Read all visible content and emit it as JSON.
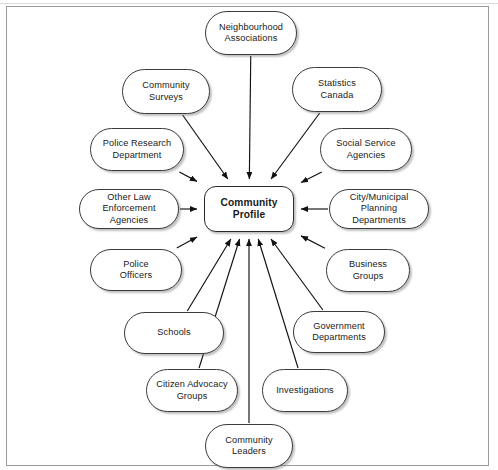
{
  "diagram": {
    "type": "radial-concept-map",
    "frame": {
      "border_color": "#9a9a9a"
    },
    "center": {
      "id": "community-profile",
      "label": "Community\nProfile",
      "x": 204,
      "y": 186,
      "w": 90,
      "h": 46
    },
    "nodes": [
      {
        "id": "neighbourhood-associations",
        "label": "Neighbourhood\nAssociations",
        "x": 205,
        "y": 11,
        "w": 92,
        "h": 44
      },
      {
        "id": "community-surveys",
        "label": "Community\nSurveys",
        "x": 122,
        "y": 69,
        "w": 88,
        "h": 45
      },
      {
        "id": "statistics-canada",
        "label": "Statistics\nCanada",
        "x": 292,
        "y": 67,
        "w": 90,
        "h": 45
      },
      {
        "id": "police-research-department",
        "label": "Police Research\nDepartment",
        "x": 90,
        "y": 128,
        "w": 94,
        "h": 43
      },
      {
        "id": "social-service-agencies",
        "label": "Social Service\nAgencies",
        "x": 320,
        "y": 128,
        "w": 92,
        "h": 43
      },
      {
        "id": "other-law-enforcement",
        "label": "Other Law Enforcement\nAgencies",
        "x": 79,
        "y": 189,
        "w": 100,
        "h": 40
      },
      {
        "id": "city-municipal-planning",
        "label": "City/Municipal\nPlanning Departments",
        "x": 329,
        "y": 189,
        "w": 100,
        "h": 40
      },
      {
        "id": "police-officers",
        "label": "Police\nOfficers",
        "x": 90,
        "y": 249,
        "w": 92,
        "h": 42
      },
      {
        "id": "business-groups",
        "label": "Business\nGroups",
        "x": 326,
        "y": 249,
        "w": 84,
        "h": 43
      },
      {
        "id": "schools",
        "label": "Schools",
        "x": 124,
        "y": 312,
        "w": 100,
        "h": 42
      },
      {
        "id": "government-departments",
        "label": "Government\nDepartments",
        "x": 293,
        "y": 311,
        "w": 92,
        "h": 42
      },
      {
        "id": "citizen-advocacy-groups",
        "label": "Citizen Advocacy\nGroups",
        "x": 146,
        "y": 369,
        "w": 92,
        "h": 43
      },
      {
        "id": "investigations",
        "label": "Investigations",
        "x": 262,
        "y": 369,
        "w": 86,
        "h": 43
      },
      {
        "id": "community-leaders",
        "label": "Community\nLeaders",
        "x": 205,
        "y": 424,
        "w": 88,
        "h": 44
      }
    ],
    "edges": [
      {
        "from": "neighbourhood-associations",
        "to": "community-profile",
        "arrow": true
      },
      {
        "from": "community-surveys",
        "to": "community-profile",
        "arrow": true
      },
      {
        "from": "statistics-canada",
        "to": "community-profile",
        "arrow": true
      },
      {
        "from": "police-research-department",
        "to": "community-profile",
        "arrow": true
      },
      {
        "from": "social-service-agencies",
        "to": "community-profile",
        "arrow": true
      },
      {
        "from": "other-law-enforcement",
        "to": "community-profile",
        "arrow": true
      },
      {
        "from": "city-municipal-planning",
        "to": "community-profile",
        "arrow": true
      },
      {
        "from": "police-officers",
        "to": "community-profile",
        "arrow": true
      },
      {
        "from": "business-groups",
        "to": "community-profile",
        "arrow": true
      },
      {
        "from": "schools",
        "to": "community-profile",
        "arrow": true
      },
      {
        "from": "government-departments",
        "to": "community-profile",
        "arrow": true
      },
      {
        "from": "citizen-advocacy-groups",
        "to": "community-profile",
        "arrow": true
      },
      {
        "from": "investigations",
        "to": "community-profile",
        "arrow": true
      },
      {
        "from": "community-leaders",
        "to": "community-profile",
        "arrow": true
      }
    ],
    "style": {
      "node_fill": "#ffffff",
      "node_stroke": "#3b3b3b",
      "edge_stroke": "#1a1a1a",
      "text_color": "#1a1a1a"
    }
  }
}
